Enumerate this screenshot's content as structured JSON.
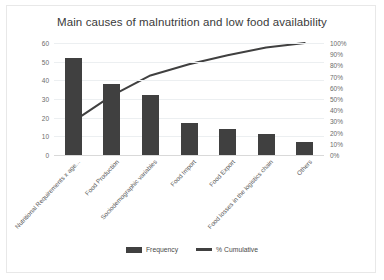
{
  "chart_data": {
    "type": "bar",
    "title": "Main causes of malnutrition and low food availability",
    "xlabel": "",
    "ylabel": "",
    "categories": [
      "Nutritional Requirements x age...",
      "Food Production",
      "Sociodemographic variables",
      "Food Import",
      "Food Export",
      "Food losses in the logistics chain",
      "Others"
    ],
    "series": [
      {
        "name": "Frequency",
        "type": "bar",
        "axis": "left",
        "values": [
          52,
          38,
          32,
          17,
          14,
          11,
          7
        ]
      },
      {
        "name": "% Cumulative",
        "type": "line",
        "axis": "right",
        "values": [
          30,
          53,
          71,
          81,
          89,
          96,
          100
        ]
      }
    ],
    "ylim": [
      0,
      60
    ],
    "yticks": [
      "0",
      "10",
      "20",
      "30",
      "40",
      "50",
      "60"
    ],
    "y2lim": [
      0,
      100
    ],
    "y2ticks": [
      "0%",
      "10%",
      "20%",
      "30%",
      "40%",
      "50%",
      "60%",
      "70%",
      "80%",
      "90%",
      "100%"
    ],
    "grid": true,
    "legend": [
      "Frequency",
      "% Cumulative"
    ],
    "legend_position": "bottom",
    "colors": {
      "bar": "#404040",
      "line": "#404040",
      "grid": "#eceff1",
      "text": "#5a5a5a",
      "background": "#ffffff"
    }
  }
}
